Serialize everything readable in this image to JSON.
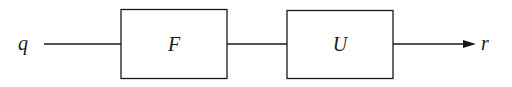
{
  "diagram": {
    "input_label": "q",
    "output_label": "r",
    "blocks": [
      {
        "label": "F"
      },
      {
        "label": "U"
      }
    ],
    "colors": {
      "stroke": "#1a1a1a",
      "background": "#ffffff"
    }
  }
}
